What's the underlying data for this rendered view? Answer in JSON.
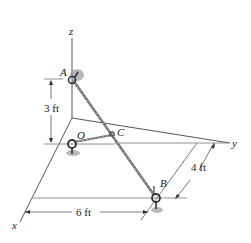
{
  "diagram": {
    "axes": {
      "x": "x",
      "y": "y",
      "z": "z"
    },
    "points": {
      "A": "A",
      "B": "B",
      "C": "C",
      "O": "O"
    },
    "dimensions": {
      "height_A": "3 ft",
      "depth_B": "4 ft",
      "width_B": "6 ft"
    },
    "colors": {
      "line": "#2a2a2a",
      "rope": "#8a8a8a",
      "shadow": "#9a9a9a"
    }
  }
}
